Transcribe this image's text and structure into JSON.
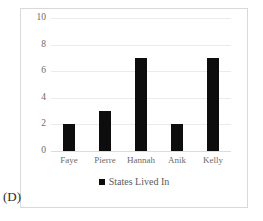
{
  "panel": {
    "letter": "(D)"
  },
  "colors": {
    "bar": "#0d0d0d",
    "gridline": "#ebebeb",
    "frame_border": "#d9d9d9",
    "axis_text": "#6b6b6b",
    "legend_text": "#5a5a5a",
    "background": "#ffffff"
  },
  "legend": {
    "position": "bottom-center",
    "marker": "square-marker",
    "entries": [
      {
        "label": "States Lived In",
        "color": "#0d0d0d"
      }
    ]
  },
  "axis": {
    "y_ticks": [
      "0",
      "2",
      "4",
      "6",
      "8",
      "10"
    ],
    "x_ticks": [
      "Faye",
      "Pierre",
      "Hannah",
      "Anik",
      "Kelly"
    ]
  },
  "chart_data": {
    "type": "bar",
    "title": "",
    "xlabel": "",
    "ylabel": "",
    "categories": [
      "Faye",
      "Pierre",
      "Hannah",
      "Anik",
      "Kelly"
    ],
    "values": [
      2,
      3,
      7,
      2,
      7
    ],
    "series": [
      {
        "name": "States Lived In",
        "color": "#0d0d0d",
        "values": [
          2,
          3,
          7,
          2,
          7
        ]
      }
    ],
    "ylim": [
      0,
      10
    ],
    "ytick_values": [
      0,
      2,
      4,
      6,
      8,
      10
    ],
    "grid": "horizontal",
    "legend_position": "bottom"
  }
}
